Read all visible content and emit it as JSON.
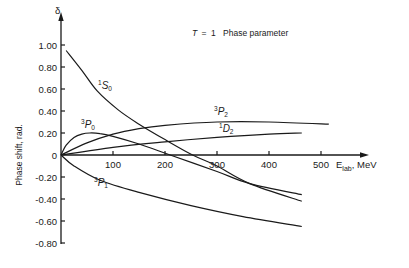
{
  "chart_data": {
    "type": "line",
    "title": "T = 1  Phase parameter",
    "title_parts": {
      "variable": "T",
      "equals": "=",
      "value": "1",
      "text": "Phase parameter"
    },
    "xlabel": "E_lab, MeV",
    "xlabel_parts": {
      "main": "E",
      "sub": "lab",
      "unit": ", MeV"
    },
    "ylabel": "Phase shift, rad.",
    "y_symbol": "δ",
    "xlim": [
      0,
      600
    ],
    "ylim": [
      -0.8,
      1.1
    ],
    "x_ticks": [
      100,
      200,
      300,
      400,
      500
    ],
    "x_tick_labels": [
      "100",
      "200",
      "300",
      "400",
      "500"
    ],
    "y_ticks": [
      1.0,
      0.8,
      0.6,
      0.4,
      0.2,
      0,
      -0.2,
      -0.4,
      -0.6,
      -0.8
    ],
    "y_tick_labels": [
      "1.00",
      "0.80",
      "0.60",
      "0.40",
      "0.20",
      "0",
      "-0.20",
      "-0.40",
      "-0.60",
      "-0.80"
    ],
    "grid": false,
    "legend": "inline labels",
    "series": [
      {
        "name": "1S0",
        "label_sup": "1",
        "label_main": "S",
        "label_sub": "0",
        "x": [
          10,
          40,
          70,
          110,
          150,
          200,
          253,
          300,
          363,
          463
        ],
        "y": [
          0.95,
          0.77,
          0.58,
          0.41,
          0.28,
          0.14,
          0.0,
          -0.1,
          -0.26,
          -0.42
        ]
      },
      {
        "name": "3P0",
        "label_sup": "3",
        "label_main": "P",
        "label_sub": "0",
        "x": [
          0,
          10,
          25,
          40,
          55,
          75,
          100,
          150,
          210,
          300,
          363,
          463
        ],
        "y": [
          0.0,
          0.09,
          0.16,
          0.19,
          0.2,
          0.195,
          0.17,
          0.1,
          0.0,
          -0.15,
          -0.26,
          -0.36
        ]
      },
      {
        "name": "3P2",
        "label_sup": "3",
        "label_main": "P",
        "label_sub": "2",
        "x": [
          0,
          50,
          100,
          150,
          200,
          300,
          400,
          515
        ],
        "y": [
          0.0,
          0.11,
          0.19,
          0.24,
          0.27,
          0.3,
          0.3,
          0.28
        ]
      },
      {
        "name": "1D2",
        "label_sup": "1",
        "label_main": "D",
        "label_sub": "2",
        "x": [
          0,
          100,
          200,
          300,
          400,
          463
        ],
        "y": [
          0.0,
          0.07,
          0.12,
          0.16,
          0.19,
          0.2
        ]
      },
      {
        "name": "3P1",
        "label_sup": "3",
        "label_main": "P",
        "label_sub": "1",
        "x": [
          0,
          25,
          75,
          150,
          250,
          350,
          463
        ],
        "y": [
          0.0,
          -0.1,
          -0.23,
          -0.34,
          -0.46,
          -0.56,
          -0.65
        ]
      }
    ]
  }
}
